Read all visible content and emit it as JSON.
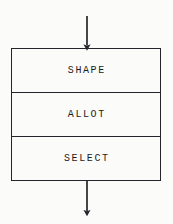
{
  "diagram": {
    "type": "flowchart",
    "title": "",
    "background_color": "#fbfbfa",
    "line_color": "#25242a",
    "text_color": "#1d1c20",
    "process_box": {
      "name": "three-section-process-box",
      "rows": [
        {
          "label": "SHAPE"
        },
        {
          "label": "ALLOT"
        },
        {
          "label": "SELECT"
        }
      ]
    },
    "connectors": [
      {
        "name": "inbound-arrow",
        "direction": "down",
        "position": "top",
        "head": "filled-triangle"
      },
      {
        "name": "outbound-arrow",
        "direction": "down",
        "position": "bottom",
        "head": "filled-triangle"
      }
    ]
  }
}
